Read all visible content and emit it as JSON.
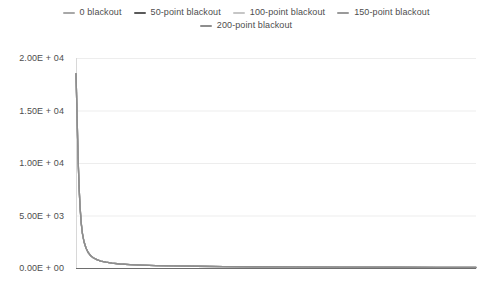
{
  "legend": {
    "position": "top-center",
    "rows": [
      [
        {
          "label": "0 blackout",
          "color": "#a8a8a8"
        },
        {
          "label": "50-point blackout",
          "color": "#5a5a5a"
        },
        {
          "label": "100-point blackout",
          "color": "#c6c6c6"
        },
        {
          "label": "150-point blackout",
          "color": "#9a9a9a"
        }
      ],
      [
        {
          "label": "200-point blackout",
          "color": "#8e8e8e"
        }
      ]
    ]
  },
  "axes": {
    "y": {
      "ticks": [
        "2.00E + 04",
        "1.50E + 04",
        "1.00E + 04",
        "5.00E + 03",
        "0.00E + 00"
      ],
      "values": [
        20000,
        15000,
        10000,
        5000,
        0
      ],
      "min": 0,
      "max": 20000,
      "label": ""
    },
    "x": {
      "ticks": [],
      "label": "",
      "min": 0,
      "max": 1000
    }
  },
  "colors": {
    "gridline": "#ededed",
    "axis": "#d8d8d8",
    "text": "#4d4d4d",
    "background": "#ffffff"
  },
  "chart_data": {
    "type": "line",
    "title": "",
    "xlabel": "",
    "ylabel": "",
    "ylim": [
      0,
      20000
    ],
    "xlim": [
      0,
      1000
    ],
    "grid": true,
    "legend_position": "top-center",
    "x": [
      0,
      2,
      4,
      6,
      8,
      10,
      13,
      16,
      20,
      25,
      30,
      36,
      43,
      52,
      62,
      75,
      90,
      110,
      135,
      165,
      200,
      245,
      300,
      370,
      450,
      550,
      660,
      790,
      900,
      1000
    ],
    "series": [
      {
        "name": "0 blackout",
        "color": "#a8a8a8",
        "values": [
          18500,
          15600,
          12400,
          9600,
          7500,
          5900,
          4300,
          3300,
          2500,
          1900,
          1500,
          1200,
          980,
          800,
          660,
          550,
          460,
          380,
          320,
          270,
          230,
          195,
          165,
          140,
          120,
          100,
          85,
          70,
          60,
          50
        ]
      },
      {
        "name": "50-point blackout",
        "color": "#5a5a5a",
        "values": [
          18500,
          15600,
          12400,
          9600,
          7500,
          5900,
          4300,
          3300,
          2500,
          1900,
          1500,
          1200,
          980,
          800,
          660,
          550,
          460,
          380,
          320,
          270,
          230,
          195,
          165,
          140,
          120,
          100,
          85,
          70,
          60,
          50
        ]
      },
      {
        "name": "100-point blackout",
        "color": "#c6c6c6",
        "values": [
          18500,
          15600,
          12400,
          9600,
          7500,
          5900,
          4300,
          3300,
          2500,
          1900,
          1500,
          1200,
          980,
          800,
          660,
          550,
          460,
          380,
          320,
          270,
          230,
          195,
          165,
          140,
          120,
          100,
          85,
          70,
          60,
          50
        ]
      },
      {
        "name": "150-point blackout",
        "color": "#9a9a9a",
        "values": [
          18500,
          15600,
          12400,
          9600,
          7500,
          5900,
          4300,
          3300,
          2500,
          1900,
          1500,
          1200,
          980,
          800,
          660,
          550,
          460,
          380,
          320,
          270,
          230,
          195,
          165,
          140,
          120,
          100,
          85,
          70,
          60,
          50
        ]
      },
      {
        "name": "200-point blackout",
        "color": "#8e8e8e",
        "values": [
          18500,
          15600,
          12400,
          9600,
          7500,
          5900,
          4300,
          3300,
          2500,
          1900,
          1500,
          1200,
          980,
          800,
          660,
          550,
          460,
          380,
          320,
          270,
          230,
          195,
          165,
          140,
          120,
          100,
          85,
          70,
          60,
          50
        ]
      }
    ]
  }
}
